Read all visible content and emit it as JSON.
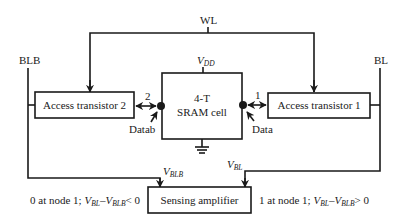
{
  "diagram": {
    "signals": {
      "wl": "WL",
      "blb": "BLB",
      "bl": "BL",
      "vdd_main": "V",
      "vdd_sub": "DD",
      "vblb_main": "V",
      "vblb_sub": "BLB",
      "vbl_main": "V",
      "vbl_sub": "BL"
    },
    "blocks": {
      "access_transistor_2": "Access transistor 2",
      "access_transistor_1": "Access transistor 1",
      "sram_cell_line1": "4-T",
      "sram_cell_line2": "SRAM cell",
      "sensing_amplifier": "Sensing amplifier"
    },
    "nodes": {
      "node2": "2",
      "node1": "1",
      "datab": "Datab",
      "data": "Data"
    },
    "annotations": {
      "left": {
        "prefix": "0 at node 1; ",
        "v1": "V",
        "v1_sub": "BL",
        "minus": "–",
        "v2": "V",
        "v2_sub": "BLB",
        "relation": "< 0"
      },
      "right": {
        "prefix": "1 at node 1; ",
        "v1": "V",
        "v1_sub": "BL",
        "minus": "–",
        "v2": "V",
        "v2_sub": "BLB",
        "relation": "> 0"
      }
    },
    "colors": {
      "stroke": "#1a1a1a",
      "background": "#ffffff"
    }
  }
}
